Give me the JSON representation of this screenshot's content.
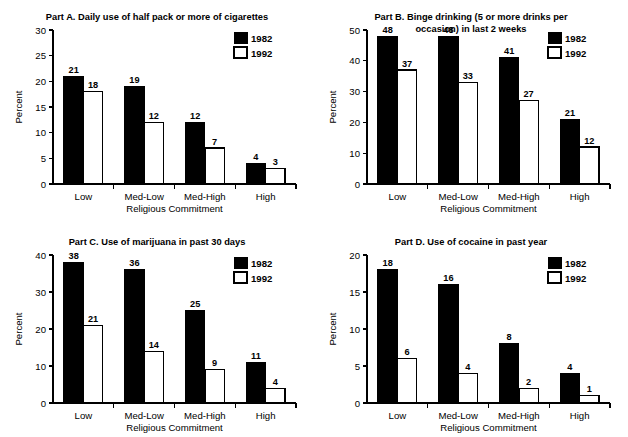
{
  "figure": {
    "series_names": [
      "1982",
      "1992"
    ],
    "series_colors": {
      "1982": "#000000",
      "1992": "#ffffff"
    },
    "shared_xlabel": "Religious Commitment",
    "shared_ylabel": "Percent",
    "categories": [
      "Low",
      "Med-Low",
      "Med-High",
      "High"
    ]
  },
  "chart_data": [
    {
      "type": "bar",
      "panel": "A",
      "title": "Part A. Daily use of half pack or more of cigarettes",
      "title_lines": [
        "Part A. Daily use of half pack or more of cigarettes"
      ],
      "xlabel": "Religious Commitment",
      "ylabel": "Percent",
      "categories": [
        "Low",
        "Med-Low",
        "Med-High",
        "High"
      ],
      "ylim": [
        0,
        30
      ],
      "yticks": [
        0,
        5,
        10,
        15,
        20,
        25,
        30
      ],
      "ytick_labels": [
        "0",
        "5",
        "10",
        "15",
        "20",
        "25",
        "30"
      ],
      "grid": false,
      "legend_position": "top-right",
      "series": [
        {
          "name": "1982",
          "values": [
            21,
            19,
            12,
            4
          ]
        },
        {
          "name": "1992",
          "values": [
            18,
            12,
            7,
            3
          ]
        }
      ]
    },
    {
      "type": "bar",
      "panel": "B",
      "title": "Part B. Binge drinking (5 or more drinks per occasion) in last 2 weeks",
      "title_lines": [
        "Part B. Binge drinking (5 or more drinks per",
        "occasion) in last 2 weeks"
      ],
      "xlabel": "Religious Commitment",
      "ylabel": "Percent",
      "categories": [
        "Low",
        "Med-Low",
        "Med-High",
        "High"
      ],
      "ylim": [
        0,
        50
      ],
      "yticks": [
        0,
        10,
        20,
        30,
        40,
        50
      ],
      "ytick_labels": [
        "0",
        "10",
        "20",
        "30",
        "40",
        "50"
      ],
      "grid": false,
      "legend_position": "top-right",
      "series": [
        {
          "name": "1982",
          "values": [
            48,
            48,
            41,
            21
          ]
        },
        {
          "name": "1992",
          "values": [
            37,
            33,
            27,
            12
          ]
        }
      ]
    },
    {
      "type": "bar",
      "panel": "C",
      "title": "Part C. Use of marijuana in past 30 days",
      "title_lines": [
        "Part C. Use of marijuana in past 30 days"
      ],
      "xlabel": "Religious Commitment",
      "ylabel": "Percent",
      "categories": [
        "Low",
        "Med-Low",
        "Med-High",
        "High"
      ],
      "ylim": [
        0,
        40
      ],
      "yticks": [
        0,
        10,
        20,
        30,
        40
      ],
      "ytick_labels": [
        "0",
        "10",
        "20",
        "30",
        "40"
      ],
      "grid": false,
      "legend_position": "top-right",
      "series": [
        {
          "name": "1982",
          "values": [
            38,
            36,
            25,
            11
          ]
        },
        {
          "name": "1992",
          "values": [
            21,
            14,
            9,
            4
          ]
        }
      ]
    },
    {
      "type": "bar",
      "panel": "D",
      "title": "Part D. Use of cocaine in past year",
      "title_lines": [
        "Part D. Use of cocaine in past year"
      ],
      "xlabel": "Religious Commitment",
      "ylabel": "Percent",
      "categories": [
        "Low",
        "Med-Low",
        "Med-High",
        "High"
      ],
      "ylim": [
        0,
        20
      ],
      "yticks": [
        0,
        5,
        10,
        15,
        20
      ],
      "ytick_labels": [
        "0",
        "5",
        "10",
        "15",
        "20"
      ],
      "grid": false,
      "legend_position": "top-right",
      "series": [
        {
          "name": "1982",
          "values": [
            18,
            16,
            8,
            4
          ]
        },
        {
          "name": "1992",
          "values": [
            6,
            4,
            2,
            1
          ]
        }
      ]
    }
  ]
}
